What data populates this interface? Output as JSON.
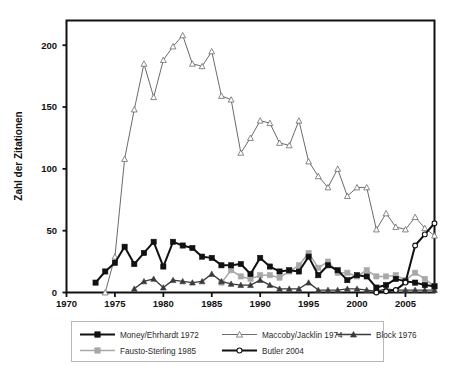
{
  "chart_data": {
    "type": "line",
    "title": "",
    "subtitle": "",
    "xlabel": "",
    "ylabel": "Zahl der Zitationen",
    "xlim": [
      1970,
      2008
    ],
    "ylim": [
      0,
      220
    ],
    "xticks": [
      1970,
      1975,
      1980,
      1985,
      1990,
      1995,
      2000,
      2005
    ],
    "yticks": [
      0,
      50,
      100,
      150,
      200
    ],
    "grid": false,
    "legend_position": "below",
    "x": [
      1973,
      1974,
      1975,
      1976,
      1977,
      1978,
      1979,
      1980,
      1981,
      1982,
      1983,
      1984,
      1985,
      1986,
      1987,
      1988,
      1989,
      1990,
      1991,
      1992,
      1993,
      1994,
      1995,
      1996,
      1997,
      1998,
      1999,
      2000,
      2001,
      2002,
      2003,
      2004,
      2005,
      2006,
      2007,
      2008
    ],
    "series": [
      {
        "name": "Money/Ehrhardt 1972",
        "marker": "filled-square",
        "color": "#111111",
        "x": [
          1973,
          1974,
          1975,
          1976,
          1977,
          1978,
          1979,
          1980,
          1981,
          1982,
          1983,
          1984,
          1985,
          1986,
          1987,
          1988,
          1989,
          1990,
          1991,
          1992,
          1993,
          1994,
          1995,
          1996,
          1997,
          1998,
          1999,
          2000,
          2001,
          2002,
          2003,
          2004,
          2005,
          2006,
          2007,
          2008
        ],
        "values": [
          8,
          17,
          24,
          37,
          23,
          32,
          41,
          21,
          41,
          38,
          36,
          29,
          28,
          22,
          22,
          23,
          15,
          28,
          21,
          17,
          18,
          17,
          29,
          14,
          22,
          18,
          10,
          14,
          13,
          4,
          6,
          11,
          9,
          8,
          6,
          5
        ]
      },
      {
        "name": "Maccoby/Jacklin 1974",
        "marker": "open-triangle",
        "color": "#6b6b6b",
        "x": [
          1974,
          1975,
          1976,
          1977,
          1978,
          1979,
          1980,
          1981,
          1982,
          1983,
          1984,
          1985,
          1986,
          1987,
          1988,
          1989,
          1990,
          1991,
          1992,
          1993,
          1994,
          1995,
          1996,
          1997,
          1998,
          1999,
          2000,
          2001,
          2002,
          2003,
          2004,
          2005,
          2006,
          2007,
          2008
        ],
        "values": [
          0,
          29,
          108,
          148,
          185,
          158,
          188,
          199,
          208,
          185,
          183,
          195,
          159,
          156,
          113,
          125,
          139,
          137,
          121,
          119,
          139,
          106,
          94,
          85,
          100,
          78,
          85,
          85,
          51,
          64,
          53,
          51,
          61,
          52,
          46
        ]
      },
      {
        "name": "Block 1976",
        "marker": "filled-triangle",
        "color": "#3a3a3a",
        "x": [
          1977,
          1978,
          1979,
          1980,
          1981,
          1982,
          1983,
          1984,
          1985,
          1986,
          1987,
          1988,
          1989,
          1990,
          1991,
          1992,
          1993,
          1994,
          1995,
          1996,
          1997,
          1998,
          1999,
          2000,
          2001,
          2002,
          2003,
          2004,
          2005,
          2006,
          2007,
          2008
        ],
        "values": [
          3,
          9,
          11,
          4,
          10,
          9,
          8,
          9,
          15,
          9,
          7,
          6,
          6,
          10,
          6,
          3,
          3,
          3,
          8,
          2,
          2,
          2,
          3,
          3,
          2,
          1,
          3,
          2,
          2,
          2,
          2,
          2
        ]
      },
      {
        "name": "Fausto-Sterling 1985",
        "marker": "filled-square",
        "color": "#a8a8a8",
        "x": [
          1986,
          1987,
          1988,
          1989,
          1990,
          1991,
          1992,
          1993,
          1994,
          1995,
          1996,
          1997,
          1998,
          1999,
          2000,
          2001,
          2002,
          2003,
          2004,
          2005,
          2006,
          2007,
          2008
        ],
        "values": [
          8,
          18,
          13,
          11,
          14,
          14,
          12,
          17,
          22,
          32,
          20,
          25,
          16,
          16,
          13,
          18,
          13,
          13,
          14,
          10,
          16,
          11,
          5
        ]
      },
      {
        "name": "Butler 2004",
        "marker": "open-circle",
        "color": "#111111",
        "x": [
          2002,
          2003,
          2004,
          2005,
          2006,
          2007,
          2008
        ],
        "values": [
          0,
          1,
          2,
          8,
          38,
          47,
          56
        ]
      }
    ]
  },
  "axes": {
    "ylabel": "Zahl der Zitationen",
    "ytick_labels": [
      "0",
      "50",
      "100",
      "150",
      "200"
    ],
    "xtick_labels": [
      "1970",
      "1975",
      "1980",
      "1985",
      "1990",
      "1995",
      "2000",
      "2005"
    ]
  },
  "legend": {
    "rows": [
      [
        {
          "label": "Money/Ehrhardt 1972",
          "marker": "filled-square",
          "color": "#111111",
          "line": "#111111",
          "lineWidth": 2.0
        },
        {
          "label": "Maccoby/Jacklin 1974",
          "marker": "open-triangle",
          "color": "#ffffff",
          "line": "#6b6b6b",
          "lineWidth": 1.1
        },
        {
          "label": "Block 1976",
          "marker": "filled-triangle",
          "color": "#3a3a3a",
          "line": "#3a3a3a",
          "lineWidth": 1.4
        }
      ],
      [
        {
          "label": "Fausto-Sterling 1985",
          "marker": "filled-square",
          "color": "#a8a8a8",
          "line": "#a8a8a8",
          "lineWidth": 1.4
        },
        {
          "label": "Butler 2004",
          "marker": "open-circle",
          "color": "#ffffff",
          "line": "#111111",
          "lineWidth": 2.0
        }
      ]
    ]
  },
  "colors": {
    "axis": "#111111",
    "plot_border": "#111111",
    "legend_border": "#b9b9b9",
    "background": "#ffffff"
  }
}
